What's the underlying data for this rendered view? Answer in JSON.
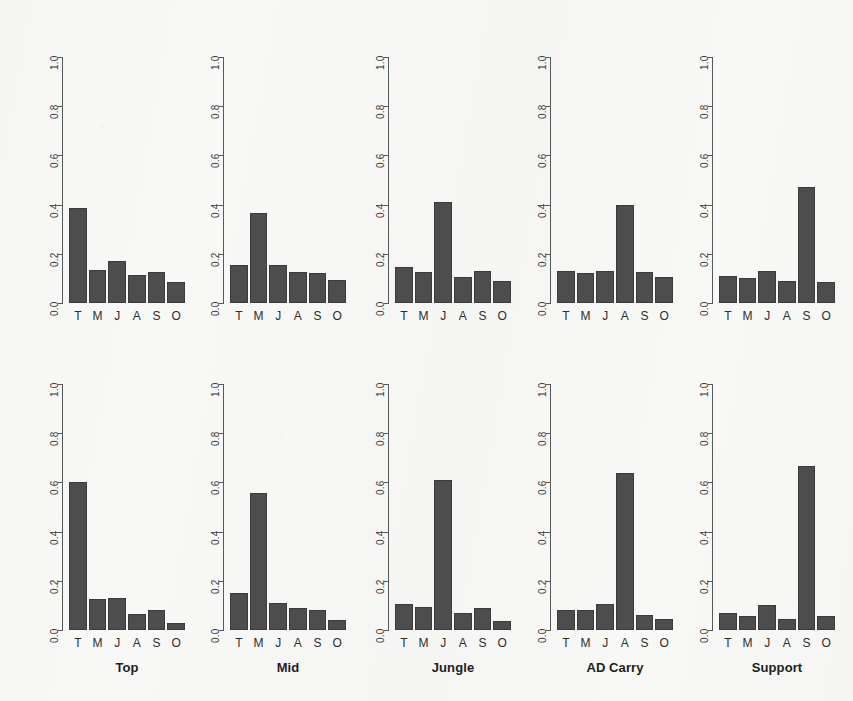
{
  "figure": {
    "background_color": "#f8f8f6",
    "bar_fill_color": "#4d4d4d",
    "bar_border_color": "#3b3b3b",
    "axis_color": "#585858",
    "rows": 2,
    "cols": 5
  },
  "chart_data": [
    {
      "type": "bar",
      "title": "",
      "panel_title": "Top",
      "row": 0,
      "col": 0,
      "xlabel": "",
      "ylabel": "",
      "categories": [
        "T",
        "M",
        "J",
        "A",
        "S",
        "O"
      ],
      "values": [
        0.385,
        0.135,
        0.17,
        0.115,
        0.125,
        0.085
      ],
      "ylim": [
        0.0,
        1.0
      ],
      "yticks": [
        "0.0",
        "0.2",
        "0.4",
        "0.6",
        "0.8",
        "1.0"
      ],
      "grid": false,
      "legend": "none"
    },
    {
      "type": "bar",
      "title": "",
      "panel_title": "Mid",
      "row": 0,
      "col": 1,
      "xlabel": "",
      "ylabel": "",
      "categories": [
        "T",
        "M",
        "J",
        "A",
        "S",
        "O"
      ],
      "values": [
        0.155,
        0.365,
        0.155,
        0.125,
        0.12,
        0.095
      ],
      "ylim": [
        0.0,
        1.0
      ],
      "yticks": [
        "0.0",
        "0.2",
        "0.4",
        "0.6",
        "0.8",
        "1.0"
      ],
      "grid": false,
      "legend": "none"
    },
    {
      "type": "bar",
      "title": "",
      "panel_title": "Jungle",
      "row": 0,
      "col": 2,
      "xlabel": "",
      "ylabel": "",
      "categories": [
        "T",
        "M",
        "J",
        "A",
        "S",
        "O"
      ],
      "values": [
        0.145,
        0.125,
        0.41,
        0.105,
        0.13,
        0.09
      ],
      "ylim": [
        0.0,
        1.0
      ],
      "yticks": [
        "0.0",
        "0.2",
        "0.4",
        "0.6",
        "0.8",
        "1.0"
      ],
      "grid": false,
      "legend": "none"
    },
    {
      "type": "bar",
      "title": "",
      "panel_title": "AD Carry",
      "row": 0,
      "col": 3,
      "xlabel": "",
      "ylabel": "",
      "categories": [
        "T",
        "M",
        "J",
        "A",
        "S",
        "O"
      ],
      "values": [
        0.13,
        0.12,
        0.13,
        0.4,
        0.125,
        0.105
      ],
      "ylim": [
        0.0,
        1.0
      ],
      "yticks": [
        "0.0",
        "0.2",
        "0.4",
        "0.6",
        "0.8",
        "1.0"
      ],
      "grid": false,
      "legend": "none"
    },
    {
      "type": "bar",
      "title": "",
      "panel_title": "Support",
      "row": 0,
      "col": 4,
      "xlabel": "",
      "ylabel": "",
      "categories": [
        "T",
        "M",
        "J",
        "A",
        "S",
        "O"
      ],
      "values": [
        0.11,
        0.1,
        0.13,
        0.09,
        0.47,
        0.085
      ],
      "ylim": [
        0.0,
        1.0
      ],
      "yticks": [
        "0.0",
        "0.2",
        "0.4",
        "0.6",
        "0.8",
        "1.0"
      ],
      "grid": false,
      "legend": "none"
    },
    {
      "type": "bar",
      "title": "",
      "panel_title": "Top",
      "row": 1,
      "col": 0,
      "xlabel": "",
      "ylabel": "",
      "categories": [
        "T",
        "M",
        "J",
        "A",
        "S",
        "O"
      ],
      "values": [
        0.6,
        0.125,
        0.13,
        0.065,
        0.08,
        0.03
      ],
      "ylim": [
        0.0,
        1.0
      ],
      "yticks": [
        "0.0",
        "0.2",
        "0.4",
        "0.6",
        "0.8",
        "1.0"
      ],
      "grid": false,
      "legend": "none"
    },
    {
      "type": "bar",
      "title": "",
      "panel_title": "Mid",
      "row": 1,
      "col": 1,
      "xlabel": "",
      "ylabel": "",
      "categories": [
        "T",
        "M",
        "J",
        "A",
        "S",
        "O"
      ],
      "values": [
        0.15,
        0.555,
        0.11,
        0.09,
        0.08,
        0.04
      ],
      "ylim": [
        0.0,
        1.0
      ],
      "yticks": [
        "0.0",
        "0.2",
        "0.4",
        "0.6",
        "0.8",
        "1.0"
      ],
      "grid": false,
      "legend": "none"
    },
    {
      "type": "bar",
      "title": "",
      "panel_title": "Jungle",
      "row": 1,
      "col": 2,
      "xlabel": "",
      "ylabel": "",
      "categories": [
        "T",
        "M",
        "J",
        "A",
        "S",
        "O"
      ],
      "values": [
        0.105,
        0.095,
        0.61,
        0.07,
        0.09,
        0.035
      ],
      "ylim": [
        0.0,
        1.0
      ],
      "yticks": [
        "0.0",
        "0.2",
        "0.4",
        "0.6",
        "0.8",
        "1.0"
      ],
      "grid": false,
      "legend": "none"
    },
    {
      "type": "bar",
      "title": "",
      "panel_title": "AD Carry",
      "row": 1,
      "col": 3,
      "xlabel": "",
      "ylabel": "",
      "categories": [
        "T",
        "M",
        "J",
        "A",
        "S",
        "O"
      ],
      "values": [
        0.08,
        0.08,
        0.105,
        0.64,
        0.06,
        0.045
      ],
      "ylim": [
        0.0,
        1.0
      ],
      "yticks": [
        "0.0",
        "0.2",
        "0.4",
        "0.6",
        "0.8",
        "1.0"
      ],
      "grid": false,
      "legend": "none"
    },
    {
      "type": "bar",
      "title": "",
      "panel_title": "Support",
      "row": 1,
      "col": 4,
      "xlabel": "",
      "ylabel": "",
      "categories": [
        "T",
        "M",
        "J",
        "A",
        "S",
        "O"
      ],
      "values": [
        0.07,
        0.055,
        0.1,
        0.045,
        0.665,
        0.055
      ],
      "ylim": [
        0.0,
        1.0
      ],
      "yticks": [
        "0.0",
        "0.2",
        "0.4",
        "0.6",
        "0.8",
        "1.0"
      ],
      "grid": false,
      "legend": "none"
    }
  ],
  "layout": {
    "panel_left_x": [
      62,
      223,
      388,
      550,
      712
    ],
    "row_baseline_y": [
      303,
      630
    ],
    "axis_top_y": [
      57,
      384
    ],
    "plot_width": 118,
    "bar_gap": 2
  }
}
